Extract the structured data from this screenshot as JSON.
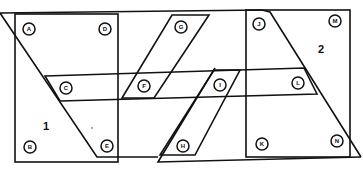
{
  "diagram": {
    "regions": [
      {
        "label": "1",
        "x": 46,
        "y": 130
      },
      {
        "label": "2",
        "x": 321,
        "y": 53
      }
    ],
    "nodes": [
      {
        "id": "A",
        "x": 29,
        "y": 29
      },
      {
        "id": "D",
        "x": 105,
        "y": 29
      },
      {
        "id": "G",
        "x": 181,
        "y": 27
      },
      {
        "id": "J",
        "x": 259,
        "y": 24
      },
      {
        "id": "M",
        "x": 335,
        "y": 21
      },
      {
        "id": "C",
        "x": 66,
        "y": 88
      },
      {
        "id": "F",
        "x": 144,
        "y": 86
      },
      {
        "id": "I",
        "x": 220,
        "y": 85
      },
      {
        "id": "L",
        "x": 298,
        "y": 83
      },
      {
        "id": "B",
        "x": 30,
        "y": 147
      },
      {
        "id": "E",
        "x": 107,
        "y": 146
      },
      {
        "id": "H",
        "x": 183,
        "y": 146
      },
      {
        "id": "K",
        "x": 262,
        "y": 144
      },
      {
        "id": "N",
        "x": 337,
        "y": 141
      }
    ],
    "tick_mark": "'"
  }
}
